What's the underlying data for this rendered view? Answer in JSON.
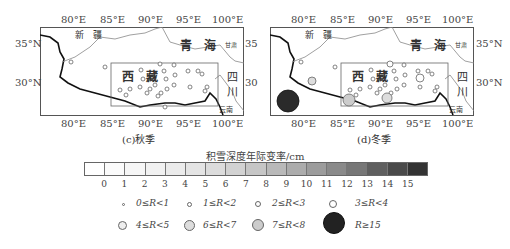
{
  "maps": [
    {
      "id": "c",
      "caption": "(c)秋季",
      "lon_ticks": [
        "80°E",
        "85°E",
        "90°E",
        "95°E",
        "100°E"
      ],
      "lat_ticks_left": [
        "35°N",
        "30°N"
      ],
      "lat_ticks_right": [
        "35",
        "30"
      ],
      "labels": {
        "xinjiang": "新　疆",
        "qinghai": "青　海",
        "gansu": "甘肃",
        "xizang": "西　藏",
        "sichuan_1": "四",
        "sichuan_2": "川",
        "yunnan": "云南"
      }
    },
    {
      "id": "d",
      "caption": "(d)冬季",
      "lon_ticks": [
        "80°E",
        "85°E",
        "90°E",
        "95°E",
        "100°E"
      ],
      "lat_ticks_left": [
        "35°N",
        "30°N"
      ],
      "lat_ticks_right": [
        "35°N",
        "30°N"
      ],
      "labels": {
        "xinjiang": "新　疆",
        "qinghai": "青　海",
        "gansu": "甘肃",
        "xizang": "西　藏",
        "sichuan_1": "四",
        "sichuan_2": "川",
        "yunnan": "云南"
      }
    }
  ],
  "colorbar": {
    "title": "积雪深度年际变率/cm",
    "tick_labels": [
      "0",
      "1",
      "2",
      "3",
      "4",
      "5",
      "6",
      "7",
      "8",
      "9",
      "10",
      "11",
      "12",
      "13",
      "14",
      "15"
    ],
    "colors": [
      "#ffffff",
      "#fbfbfb",
      "#f6f6f6",
      "#f1f1f1",
      "#ebebeb",
      "#e4e4e4",
      "#dcdcdc",
      "#d2d2d2",
      "#c6c6c6",
      "#b9b9b9",
      "#acacac",
      "#9c9c9c",
      "#8a8a8a",
      "#777777",
      "#5f5f5f",
      "#4a4a4a",
      "#333333"
    ]
  },
  "legend": {
    "row1": [
      "0≤R<1",
      "1≤R<2",
      "2≤R<3",
      "3≤R<4"
    ],
    "row2": [
      "4≤R<5",
      "6≤R<7",
      "7≤R<8",
      "R≥15"
    ]
  }
}
